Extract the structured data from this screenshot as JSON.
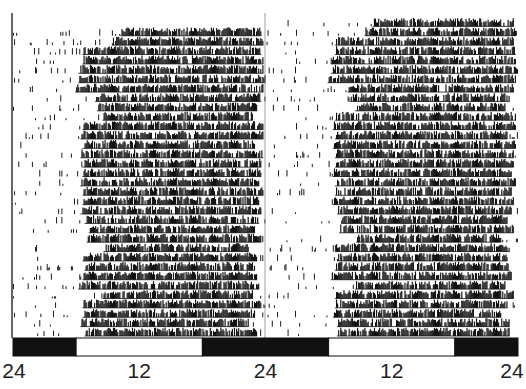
{
  "chart_data": {
    "type": "heatmap",
    "title": "",
    "subtitle": "Double-plotted actogram",
    "xlabel": "",
    "ylabel": "",
    "x_tick_labels": [
      "24",
      "12",
      "24",
      "12",
      "24"
    ],
    "x_ticks_hours": [
      0,
      12,
      24,
      36,
      48
    ],
    "xlim_hours": [
      0,
      48
    ],
    "legend": [],
    "light_dark_bar": [
      {
        "from": 0,
        "to": 6,
        "state": "dark"
      },
      {
        "from": 6,
        "to": 18,
        "state": "light"
      },
      {
        "from": 18,
        "to": 30,
        "state": "dark"
      },
      {
        "from": 30,
        "to": 42,
        "state": "light"
      },
      {
        "from": 42,
        "to": 48,
        "state": "dark"
      }
    ],
    "rows": 34,
    "activity_onset_hours": [
      10.2,
      10.2,
      9.4,
      6.6,
      6.6,
      6.2,
      6.2,
      5.9,
      7.8,
      8.0,
      8.5,
      6.6,
      6.4,
      6.6,
      6.4,
      6.6,
      6.6,
      6.4,
      6.6,
      6.6,
      6.4,
      6.8,
      7.2,
      7.0,
      8.6,
      6.6,
      6.8,
      6.6,
      6.2,
      8.5,
      6.6,
      6.6,
      6.4,
      6.8
    ],
    "activity_offset_hours": [
      23.6,
      23.6,
      23.8,
      23.6,
      23.8,
      23.8,
      24.0,
      23.8,
      23.6,
      23.2,
      22.8,
      23.8,
      23.8,
      23.0,
      23.8,
      23.6,
      23.6,
      23.4,
      23.8,
      23.4,
      23.6,
      23.4,
      23.0,
      23.6,
      22.4,
      23.2,
      23.0,
      23.2,
      23.4,
      22.8,
      23.6,
      23.0,
      22.4,
      23.2
    ],
    "grid": false,
    "axis": {
      "left_line": true,
      "midline_hour": 24
    }
  },
  "style": {
    "ink": "#111111",
    "bar_dark": "#111111",
    "bar_light": "#ffffff",
    "background": "#ffffff"
  }
}
